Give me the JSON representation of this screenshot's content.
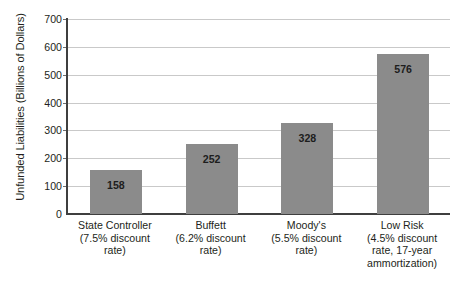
{
  "chart_data": {
    "type": "bar",
    "title": "",
    "xlabel": "",
    "ylabel": "Unfunded Liabilities (Billions of Dollars)",
    "ylim": [
      0,
      700
    ],
    "ytick_labels": [
      "700",
      "600",
      "500",
      "400",
      "300",
      "200",
      "100",
      "0"
    ],
    "ytick_values": [
      700,
      600,
      500,
      400,
      300,
      200,
      100,
      0
    ],
    "grid": "horizontal",
    "legend": "none",
    "bar_color": "#8b8b8b",
    "categories": [
      "State Controller (7.5% discount rate)",
      "Buffett (6.2% discount rate)",
      "Moody's (5.5% discount rate)",
      "Low Risk (4.5% discount rate, 17-year ammortization)"
    ],
    "category_lines": [
      [
        "State Controller",
        "(7.5% discount",
        "rate)"
      ],
      [
        "Buffett",
        "(6.2% discount",
        "rate)"
      ],
      [
        "Moody's",
        "(5.5% discount",
        "rate)"
      ],
      [
        "Low Risk",
        "(4.5% discount",
        "rate, 17-year",
        "ammortization)"
      ]
    ],
    "values": [
      158,
      252,
      328,
      576
    ],
    "value_labels": [
      "158",
      "252",
      "328",
      "576"
    ]
  }
}
